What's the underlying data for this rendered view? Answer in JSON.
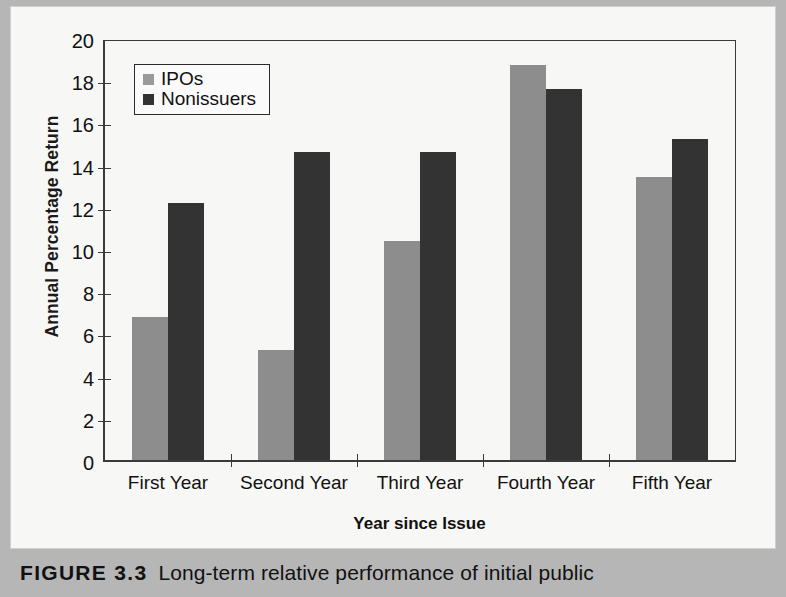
{
  "figure": {
    "caption_tag": "FIGURE 3.3",
    "caption_text": "Long-term relative performance of initial public"
  },
  "legend": {
    "items": [
      {
        "label": "IPOs",
        "color": "#8d8d8d"
      },
      {
        "label": "Nonissuers",
        "color": "#333333"
      }
    ]
  },
  "axes": {
    "y_title": "Annual Percentage Return",
    "x_title": "Year since Issue",
    "y_ticks": [
      "0",
      "2",
      "4",
      "6",
      "8",
      "10",
      "12",
      "14",
      "16",
      "18",
      "20"
    ]
  },
  "chart_data": {
    "type": "bar",
    "title": "",
    "xlabel": "Year since Issue",
    "ylabel": "Annual Percentage Return",
    "ylim": [
      0,
      20
    ],
    "ytick_step": 2,
    "grid": false,
    "legend_position": "top-left",
    "categories": [
      "First Year",
      "Second Year",
      "Third Year",
      "Fourth Year",
      "Fifth Year"
    ],
    "series": [
      {
        "name": "IPOs",
        "color": "#8d8d8d",
        "values": [
          6.8,
          5.2,
          10.4,
          18.7,
          13.4
        ]
      },
      {
        "name": "Nonissuers",
        "color": "#333333",
        "values": [
          12.2,
          14.6,
          14.6,
          17.6,
          15.2
        ]
      }
    ]
  }
}
